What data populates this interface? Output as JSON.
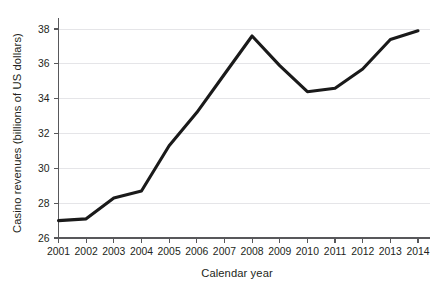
{
  "chart_data": {
    "type": "line",
    "title": "",
    "xlabel": "Calendar year",
    "ylabel": "Casino revenues (billions of US dollars)",
    "categories": [
      "2001",
      "2002",
      "2003",
      "2004",
      "2005",
      "2006",
      "2007",
      "2008",
      "2009",
      "2010",
      "2011",
      "2012",
      "2013",
      "2014"
    ],
    "x": [
      2001,
      2002,
      2003,
      2004,
      2005,
      2006,
      2007,
      2008,
      2009,
      2010,
      2011,
      2012,
      2013,
      2014
    ],
    "values": [
      27.0,
      27.1,
      28.3,
      28.7,
      31.3,
      33.2,
      35.4,
      37.6,
      35.9,
      34.4,
      34.6,
      35.7,
      37.4,
      37.9
    ],
    "series": [
      {
        "name": "Casino revenues",
        "values": [
          27.0,
          27.1,
          28.3,
          28.7,
          31.3,
          33.2,
          35.4,
          37.6,
          35.9,
          34.4,
          34.6,
          35.7,
          37.4,
          37.9
        ],
        "color": "#1a1a1a"
      }
    ],
    "xlim": [
      2001,
      2014
    ],
    "ylim": [
      26,
      38.6
    ],
    "yticks": [
      26,
      28,
      30,
      32,
      34,
      36,
      38
    ],
    "ytick_labels": [
      "26",
      "28",
      "30",
      "32",
      "34",
      "36",
      "38"
    ],
    "xticks": [
      2001,
      2002,
      2003,
      2004,
      2005,
      2006,
      2007,
      2008,
      2009,
      2010,
      2011,
      2012,
      2013,
      2014
    ],
    "xtick_labels": [
      "2001",
      "2002",
      "2003",
      "2004",
      "2005",
      "2006",
      "2007",
      "2008",
      "2009",
      "2010",
      "2011",
      "2012",
      "2013",
      "2014"
    ],
    "grid": true,
    "grid_axis": "y",
    "legend": false,
    "legend_position": "none",
    "colors": {
      "line": "#1a1a1a",
      "grid": "#e2e2e6",
      "axis": "#58585b",
      "text": "#231f20",
      "background": "#ffffff"
    }
  }
}
